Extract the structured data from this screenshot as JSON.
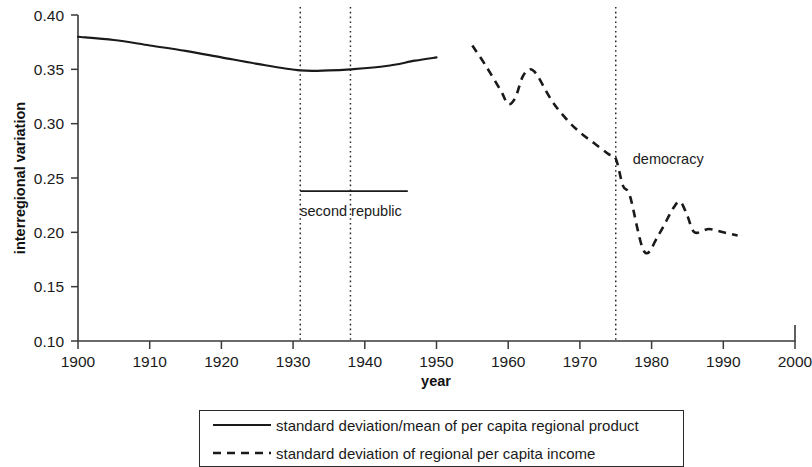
{
  "chart_data": {
    "type": "line",
    "title": "",
    "xlabel": "year",
    "ylabel": "interregional variation",
    "xlim": [
      1900,
      2000
    ],
    "ylim": [
      0.1,
      0.4
    ],
    "grid": false,
    "legend_position": "bottom",
    "x_ticks": [
      "1900",
      "1910",
      "1920",
      "1930",
      "1940",
      "1950",
      "1960",
      "1970",
      "1980",
      "1990",
      "2000"
    ],
    "y_ticks": [
      "0.10",
      "0.15",
      "0.20",
      "0.25",
      "0.30",
      "0.35",
      "0.40"
    ],
    "series": [
      {
        "name": "standard deviation/mean of per capita regional product",
        "style": "solid",
        "x": [
          1900,
          1905,
          1910,
          1915,
          1920,
          1925,
          1931,
          1935,
          1938,
          1943,
          1947,
          1950
        ],
        "values": [
          0.38,
          0.377,
          0.372,
          0.367,
          0.361,
          0.355,
          0.349,
          0.349,
          0.35,
          0.353,
          0.358,
          0.361
        ]
      },
      {
        "name": "standard deviation of regional per capita income",
        "style": "dashed",
        "x": [
          1955,
          1957,
          1959,
          1960,
          1961,
          1962,
          1963,
          1964,
          1966,
          1968,
          1970,
          1972,
          1974,
          1975,
          1976,
          1977,
          1979,
          1981,
          1983,
          1984,
          1985,
          1986,
          1988,
          1990,
          1992
        ],
        "values": [
          0.372,
          0.352,
          0.33,
          0.318,
          0.324,
          0.343,
          0.35,
          0.345,
          0.322,
          0.305,
          0.292,
          0.282,
          0.272,
          0.268,
          0.243,
          0.233,
          0.182,
          0.198,
          0.222,
          0.228,
          0.215,
          0.2,
          0.203,
          0.2,
          0.197
        ]
      }
    ],
    "annotations": [
      {
        "label": "second republic",
        "kind": "span-with-label",
        "x_start": 1931,
        "x_end": 1946,
        "y": 0.238
      },
      {
        "label": "democracy",
        "kind": "vline-label",
        "x": 1975,
        "y": 0.263
      }
    ],
    "vertical_rules": [
      1931,
      1938,
      1975
    ]
  },
  "legend": {
    "entries": [
      {
        "swatch": "solid-line",
        "label": "standard deviation/mean of per capita regional product"
      },
      {
        "swatch": "dashed-line",
        "label": "standard deviation of regional per capita income"
      }
    ]
  },
  "colors": {
    "ink": "#1a1a1a",
    "axis": "#3a3a3a",
    "background": "#ffffff"
  }
}
